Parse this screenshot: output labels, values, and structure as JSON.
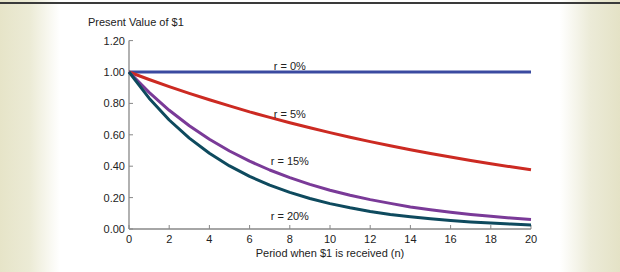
{
  "chart_data": {
    "type": "line",
    "title": "",
    "ylabel": "Present Value of $1",
    "xlabel": "Period when $1 is received (n)",
    "xlim": [
      0,
      20
    ],
    "ylim": [
      0,
      1.2
    ],
    "x_ticks": [
      "0",
      "2",
      "4",
      "6",
      "8",
      "10",
      "12",
      "14",
      "16",
      "18",
      "20"
    ],
    "y_ticks": [
      "0.00",
      "0.20",
      "0.40",
      "0.60",
      "0.80",
      "1.00",
      "1.20"
    ],
    "grid": false,
    "legend": "inline labels",
    "x": [
      0,
      1,
      2,
      3,
      4,
      5,
      6,
      7,
      8,
      9,
      10,
      11,
      12,
      13,
      14,
      15,
      16,
      17,
      18,
      19,
      20
    ],
    "series": [
      {
        "name": "r = 0%",
        "color": "#3a4aa0",
        "values": [
          1,
          1,
          1,
          1,
          1,
          1,
          1,
          1,
          1,
          1,
          1,
          1,
          1,
          1,
          1,
          1,
          1,
          1,
          1,
          1,
          1
        ]
      },
      {
        "name": "r = 5%",
        "color": "#cc2a22",
        "values": [
          1.0,
          0.952,
          0.907,
          0.864,
          0.823,
          0.784,
          0.746,
          0.711,
          0.677,
          0.645,
          0.614,
          0.585,
          0.557,
          0.53,
          0.505,
          0.481,
          0.458,
          0.436,
          0.416,
          0.396,
          0.377
        ]
      },
      {
        "name": "r = 15%",
        "color": "#7a3a98",
        "values": [
          1.0,
          0.87,
          0.756,
          0.658,
          0.572,
          0.497,
          0.432,
          0.376,
          0.327,
          0.284,
          0.247,
          0.215,
          0.187,
          0.163,
          0.141,
          0.123,
          0.107,
          0.093,
          0.081,
          0.07,
          0.061
        ]
      },
      {
        "name": "r = 20%",
        "color": "#0e4a5e",
        "values": [
          1.0,
          0.833,
          0.694,
          0.579,
          0.482,
          0.402,
          0.335,
          0.279,
          0.233,
          0.194,
          0.162,
          0.135,
          0.112,
          0.093,
          0.078,
          0.065,
          0.054,
          0.045,
          0.038,
          0.031,
          0.026
        ]
      }
    ],
    "annotations": [
      {
        "text": "r = 0%",
        "x": 8.0,
        "y": 1.04
      },
      {
        "text": "r = 5%",
        "x": 8.0,
        "y": 0.73
      },
      {
        "text": "r = 15%",
        "x": 8.0,
        "y": 0.43
      },
      {
        "text": "r = 20%",
        "x": 8.0,
        "y": 0.08
      }
    ]
  }
}
